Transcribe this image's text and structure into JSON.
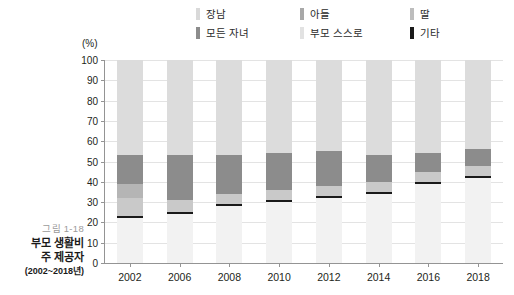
{
  "caption": {
    "figure_number": "그림 1-18",
    "title_line1": "부모 생활비",
    "title_line2": "주 제공자",
    "year_range": "(2002~2018년)"
  },
  "axis": {
    "y_unit": "(%)",
    "y_ticks": [
      "100",
      "90",
      "80",
      "70",
      "60",
      "50",
      "40",
      "30",
      "20",
      "10",
      "0"
    ],
    "y_min": 0,
    "y_max": 100,
    "x_ticks": [
      "2002",
      "2006",
      "2008",
      "2010",
      "2012",
      "2014",
      "2016",
      "2018"
    ]
  },
  "legend": {
    "rows": [
      [
        {
          "label": "장남",
          "color": "#d9d9d9"
        },
        {
          "label": "아들",
          "color": "#a8a8a8"
        },
        {
          "label": "딸",
          "color": "#bdbdbd"
        }
      ],
      [
        {
          "label": "모든 자녀",
          "color": "#8c8c8c"
        },
        {
          "label": "부모 스스로",
          "color": "#e8e8e8"
        },
        {
          "label": "기타",
          "color": "#1a1a1a"
        }
      ]
    ]
  },
  "chart_data": {
    "type": "bar",
    "stacked": true,
    "title": "부모 생활비 주 제공자 (2002~2018년)",
    "xlabel": "",
    "ylabel": "(%)",
    "ylim": [
      0,
      100
    ],
    "grid": true,
    "legend_position": "top",
    "categories": [
      "2002",
      "2006",
      "2008",
      "2010",
      "2012",
      "2014",
      "2016",
      "2018"
    ],
    "series": [
      {
        "name": "부모 스스로",
        "color": "#f2f2f2",
        "values": [
          22,
          24,
          28,
          30,
          32,
          34,
          39,
          42
        ]
      },
      {
        "name": "기타",
        "color": "#1a1a1a",
        "values": [
          1,
          1,
          1,
          1,
          1,
          1,
          1,
          1
        ]
      },
      {
        "name": "딸",
        "color": "#c9c9c9",
        "values": [
          9,
          6,
          5,
          5,
          5,
          5,
          5,
          5
        ]
      },
      {
        "name": "아들",
        "color": "#b5b5b5",
        "values": [
          7,
          0,
          0,
          0,
          0,
          0,
          0,
          0
        ]
      },
      {
        "name": "모든 자녀",
        "color": "#8c8c8c",
        "values": [
          14,
          22,
          19,
          18,
          17,
          13,
          9,
          8
        ]
      },
      {
        "name": "장남",
        "color": "#dcdcdc",
        "values": [
          47,
          47,
          47,
          46,
          45,
          47,
          46,
          44
        ]
      }
    ]
  }
}
